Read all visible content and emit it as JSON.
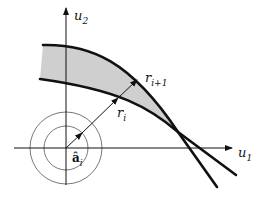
{
  "diagram": {
    "axes": {
      "x_label": "u",
      "x_sub": "1",
      "y_label": "u",
      "y_sub": "2"
    },
    "labels": {
      "r_i": {
        "base": "r",
        "sub": "i"
      },
      "r_i1": {
        "base": "r",
        "sub": "i+1"
      },
      "a_i": {
        "base": "â",
        "sub": "i"
      }
    },
    "colors": {
      "line": "#111111",
      "fill": "#cfcfcf",
      "circle": "#555555"
    }
  }
}
